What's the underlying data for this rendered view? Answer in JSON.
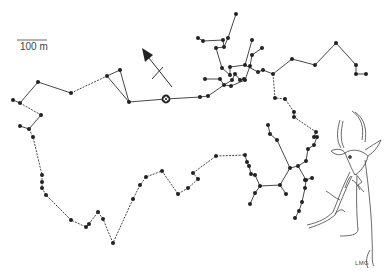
{
  "map": {
    "scale_bar": {
      "label": "100 m",
      "x1": 17,
      "x2": 47,
      "y": 40
    },
    "north_arrow": {
      "x1": 172,
      "y1": 87,
      "x2": 142,
      "y2": 48
    },
    "start_marker": {
      "x": 166,
      "y": 99,
      "symbol": "circled-cross"
    },
    "artist_initials": "LMG",
    "colors": {
      "track": "#333333",
      "point": "#222222",
      "drawing": "#444444"
    }
  },
  "tracks": [
    {
      "style": "solid",
      "points": [
        [
          13,
          100
        ],
        [
          20,
          103
        ],
        [
          38,
          82
        ],
        [
          71,
          93
        ]
      ]
    },
    {
      "style": "dashed",
      "points": [
        [
          71,
          93
        ],
        [
          107,
          76
        ]
      ]
    },
    {
      "style": "solid",
      "points": [
        [
          107,
          76
        ],
        [
          120,
          70
        ],
        [
          129,
          102
        ],
        [
          107,
          76
        ]
      ]
    },
    {
      "style": "dashed",
      "points": [
        [
          20,
          103
        ],
        [
          41,
          115
        ]
      ]
    },
    {
      "style": "solid",
      "points": [
        [
          41,
          115
        ],
        [
          29,
          129
        ],
        [
          20,
          126
        ]
      ]
    },
    {
      "style": "dashed",
      "points": [
        [
          29,
          129
        ],
        [
          33,
          137
        ],
        [
          42,
          175
        ],
        [
          42,
          182
        ],
        [
          42,
          188
        ],
        [
          46,
          195
        ],
        [
          71,
          220
        ],
        [
          86,
          227
        ],
        [
          89,
          224
        ],
        [
          98,
          212
        ],
        [
          103,
          219
        ],
        [
          113,
          243
        ],
        [
          133,
          199
        ],
        [
          140,
          185
        ],
        [
          146,
          177
        ],
        [
          162,
          171
        ],
        [
          178,
          194
        ],
        [
          188,
          188
        ],
        [
          198,
          179
        ],
        [
          193,
          173
        ]
      ]
    },
    {
      "style": "solid",
      "points": [
        [
          129,
          102
        ],
        [
          166,
          99
        ],
        [
          200,
          97
        ]
      ]
    },
    {
      "style": "solid",
      "points": [
        [
          200,
          97
        ],
        [
          208,
          96
        ],
        [
          224,
          85
        ],
        [
          220,
          79
        ],
        [
          205,
          79
        ]
      ]
    },
    {
      "style": "solid",
      "points": [
        [
          224,
          85
        ],
        [
          231,
          86
        ],
        [
          245,
          80
        ],
        [
          250,
          66
        ],
        [
          252,
          55
        ],
        [
          262,
          48
        ]
      ]
    },
    {
      "style": "solid",
      "points": [
        [
          224,
          85
        ],
        [
          232,
          80
        ],
        [
          235,
          74
        ],
        [
          240,
          80
        ],
        [
          244,
          79
        ]
      ]
    },
    {
      "style": "solid",
      "points": [
        [
          230,
          75
        ],
        [
          222,
          68
        ],
        [
          216,
          48
        ],
        [
          224,
          47
        ],
        [
          223,
          40
        ],
        [
          203,
          41
        ],
        [
          198,
          38
        ]
      ]
    },
    {
      "style": "solid",
      "points": [
        [
          224,
          47
        ],
        [
          228,
          38
        ],
        [
          236,
          14
        ]
      ]
    },
    {
      "style": "solid",
      "points": [
        [
          230,
          75
        ],
        [
          230,
          67
        ],
        [
          245,
          65
        ],
        [
          252,
          40
        ]
      ]
    },
    {
      "style": "solid",
      "points": [
        [
          245,
          65
        ],
        [
          258,
          72
        ],
        [
          263,
          70
        ],
        [
          273,
          74
        ],
        [
          292,
          59
        ],
        [
          315,
          65
        ],
        [
          336,
          43
        ],
        [
          356,
          65
        ],
        [
          356,
          74
        ],
        [
          366,
          74
        ]
      ]
    },
    {
      "style": "dashed",
      "points": [
        [
          273,
          74
        ],
        [
          275,
          98
        ],
        [
          285,
          99
        ],
        [
          294,
          112
        ],
        [
          294,
          117
        ],
        [
          316,
          132
        ]
      ]
    },
    {
      "style": "solid",
      "points": [
        [
          316,
          132
        ],
        [
          314,
          137
        ]
      ]
    },
    {
      "style": "dashed",
      "points": [
        [
          193,
          173
        ],
        [
          216,
          156
        ],
        [
          245,
          155
        ]
      ]
    },
    {
      "style": "solid",
      "points": [
        [
          245,
          155
        ],
        [
          247,
          162
        ],
        [
          249,
          166
        ],
        [
          251,
          174
        ],
        [
          255,
          175
        ],
        [
          260,
          186
        ],
        [
          280,
          185
        ],
        [
          286,
          194
        ]
      ]
    },
    {
      "style": "solid",
      "points": [
        [
          260,
          186
        ],
        [
          255,
          193
        ],
        [
          250,
          204
        ]
      ]
    },
    {
      "style": "solid",
      "points": [
        [
          280,
          185
        ],
        [
          290,
          168
        ],
        [
          298,
          166
        ],
        [
          306,
          161
        ],
        [
          308,
          149
        ],
        [
          314,
          145
        ],
        [
          317,
          137
        ]
      ]
    },
    {
      "style": "solid",
      "points": [
        [
          290,
          168
        ],
        [
          277,
          140
        ],
        [
          270,
          134
        ],
        [
          268,
          125
        ]
      ]
    },
    {
      "style": "solid",
      "points": [
        [
          298,
          166
        ],
        [
          306,
          180
        ],
        [
          305,
          188
        ],
        [
          302,
          202
        ],
        [
          299,
          211
        ],
        [
          295,
          218
        ]
      ]
    },
    {
      "style": "solid",
      "points": [
        [
          305,
          180
        ],
        [
          312,
          178
        ]
      ]
    }
  ]
}
